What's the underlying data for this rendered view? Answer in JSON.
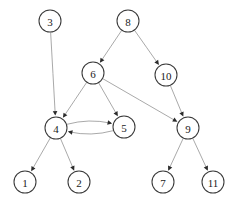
{
  "diagram": {
    "type": "directed-graph",
    "canvas": {
      "width": 242,
      "height": 206,
      "background": "#ffffff"
    },
    "style": {
      "node_fill": "#ffffff",
      "node_stroke": "#3a3a3a",
      "node_radius": 11,
      "edge_color": "#9a9a9a",
      "arrow_color": "#2b2b2b",
      "label_color": "#1a1a1a"
    },
    "nodes": [
      {
        "id": "3",
        "label": "3",
        "cx": 50,
        "cy": 21,
        "r": 11
      },
      {
        "id": "8",
        "label": "8",
        "cx": 128,
        "cy": 21,
        "r": 11
      },
      {
        "id": "6",
        "label": "6",
        "cx": 93,
        "cy": 73,
        "r": 11
      },
      {
        "id": "10",
        "label": "10",
        "cx": 166,
        "cy": 75,
        "r": 11
      },
      {
        "id": "4",
        "label": "4",
        "cx": 56,
        "cy": 128,
        "r": 11
      },
      {
        "id": "5",
        "label": "5",
        "cx": 124,
        "cy": 127,
        "r": 11
      },
      {
        "id": "9",
        "label": "9",
        "cx": 188,
        "cy": 128,
        "r": 11
      },
      {
        "id": "1",
        "label": "1",
        "cx": 25,
        "cy": 182,
        "r": 11
      },
      {
        "id": "2",
        "label": "2",
        "cx": 79,
        "cy": 182,
        "r": 11
      },
      {
        "id": "7",
        "label": "7",
        "cx": 163,
        "cy": 182,
        "r": 11
      },
      {
        "id": "11",
        "label": "11",
        "cx": 213,
        "cy": 182,
        "r": 11
      }
    ],
    "edges": [
      {
        "from": "3",
        "to": "4",
        "curve": 0
      },
      {
        "from": "8",
        "to": "6",
        "curve": 0
      },
      {
        "from": "8",
        "to": "10",
        "curve": 0
      },
      {
        "from": "6",
        "to": "4",
        "curve": 0
      },
      {
        "from": "6",
        "to": "5",
        "curve": 0
      },
      {
        "from": "6",
        "to": "9",
        "curve": 0
      },
      {
        "from": "10",
        "to": "9",
        "curve": 0
      },
      {
        "from": "4",
        "to": "5",
        "curve": -13
      },
      {
        "from": "5",
        "to": "4",
        "curve": -13
      },
      {
        "from": "4",
        "to": "1",
        "curve": 0
      },
      {
        "from": "4",
        "to": "2",
        "curve": 0
      },
      {
        "from": "9",
        "to": "7",
        "curve": 0
      },
      {
        "from": "9",
        "to": "11",
        "curve": 0
      }
    ]
  }
}
